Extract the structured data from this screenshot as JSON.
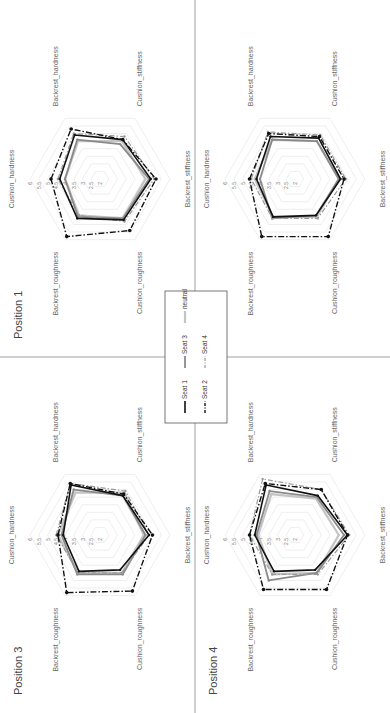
{
  "chart_data": {
    "type": "radar",
    "axes": [
      "Cushion_hardness",
      "Backrest_hardness",
      "Cushion_stiffness",
      "Backrest_stiffness",
      "Cushion_roughness",
      "Backrest_roughness"
    ],
    "ticks": [
      "2",
      "2.5",
      "3",
      "3.5",
      "4",
      "4.5",
      "5",
      "5.5",
      "6"
    ],
    "rlim": [
      2,
      6
    ],
    "legend": [
      {
        "name": "Seat 1",
        "color": "#111111",
        "style": "solid-thick"
      },
      {
        "name": "Seat 2",
        "color": "#111111",
        "style": "dash-dot"
      },
      {
        "name": "Seat 3",
        "color": "#888888",
        "style": "solid"
      },
      {
        "name": "Seat 4",
        "color": "#999999",
        "style": "dash-dot-light"
      },
      {
        "name": "neutral",
        "color": "#bbbbbb",
        "style": "solid-thin"
      }
    ],
    "panels": [
      {
        "title": "Position 1",
        "series": {
          "Seat 1": [
            4.3,
            4.9,
            4.6,
            4.9,
            4.7,
            4.6
          ],
          "Seat 2": [
            4.8,
            5.3,
            4.6,
            5.2,
            5.4,
            5.8
          ],
          "Seat 3": [
            4.0,
            4.6,
            4.3,
            4.8,
            4.6,
            4.5
          ],
          "Seat 4": [
            4.4,
            5.0,
            4.8,
            5.1,
            4.8,
            4.4
          ],
          "neutral": [
            4.0,
            4.5,
            4.5,
            4.6,
            4.6,
            4.4
          ]
        }
      },
      {
        "title": "Position 2",
        "series": {
          "Seat 1": [
            4.2,
            4.8,
            4.7,
            4.6,
            4.4,
            4.5
          ],
          "Seat 2": [
            4.6,
            5.0,
            4.8,
            4.8,
            5.8,
            5.8
          ],
          "Seat 3": [
            4.0,
            4.6,
            4.5,
            4.5,
            4.4,
            4.6
          ],
          "Seat 4": [
            4.5,
            5.1,
            4.9,
            4.9,
            4.6,
            4.6
          ],
          "neutral": [
            4.3,
            4.6,
            4.5,
            4.5,
            4.5,
            4.5
          ]
        }
      },
      {
        "title": "Position 3",
        "series": {
          "Seat 1": [
            4.1,
            5.3,
            4.6,
            4.8,
            4.3,
            4.4
          ],
          "Seat 2": [
            4.4,
            5.4,
            4.7,
            5.0,
            5.7,
            5.8
          ],
          "Seat 3": [
            4.2,
            5.0,
            4.6,
            4.6,
            4.6,
            4.6
          ],
          "Seat 4": [
            4.5,
            5.4,
            4.9,
            4.8,
            4.5,
            4.5
          ],
          "neutral": [
            4.4,
            4.8,
            4.8,
            4.5,
            4.5,
            4.5
          ]
        }
      },
      {
        "title": "Position 4",
        "series": {
          "Seat 1": [
            4.3,
            5.3,
            4.6,
            5.0,
            4.3,
            4.4
          ],
          "Seat 2": [
            4.6,
            5.4,
            5.0,
            5.0,
            5.6,
            5.6
          ],
          "Seat 3": [
            4.2,
            4.9,
            4.5,
            4.8,
            4.5,
            5.0
          ],
          "Seat 4": [
            4.6,
            5.7,
            5.0,
            5.1,
            4.6,
            4.6
          ],
          "neutral": [
            4.1,
            4.7,
            4.4,
            4.5,
            4.5,
            4.6
          ]
        }
      }
    ]
  }
}
